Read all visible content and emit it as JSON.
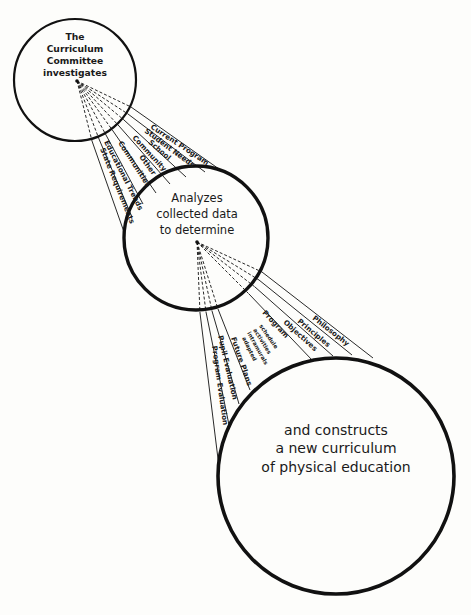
{
  "diagram": {
    "colors": {
      "ink": "#111111",
      "paper": "#fdfdfb"
    },
    "stages": [
      {
        "id": "investigate",
        "lines": [
          "The",
          "Curriculum",
          "Committee",
          "investigates"
        ]
      },
      {
        "id": "analyze",
        "lines": [
          "Analyzes",
          "collected data",
          "to determine"
        ]
      },
      {
        "id": "construct",
        "lines": [
          "and constructs",
          "a new curriculum",
          "of physical education"
        ]
      }
    ],
    "investigation_factors": [
      "Current Program",
      "Student Needs",
      "School",
      "Community",
      "Other Communities",
      "Educational Trends",
      "State Requirements"
    ],
    "determinations": {
      "philosophy": "Philosophy",
      "principles": "Principles",
      "objectives": "Objectives",
      "program": "Program",
      "program_details": [
        "schedule",
        "activities",
        "intramurals",
        "adapted"
      ],
      "future_plans": "Future Plans",
      "pupil_evaluation": "Pupil Evaluation",
      "program_evaluation": "Program Evaluation"
    }
  }
}
